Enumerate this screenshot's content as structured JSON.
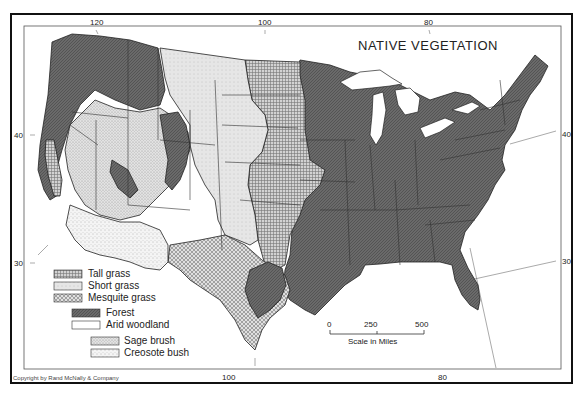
{
  "map": {
    "title": "NATIVE VEGETATION",
    "copyright": "Copyright by Rand McNally & Company",
    "longitude_labels_top": [
      "120",
      "100",
      "80"
    ],
    "longitude_labels_bottom": [
      "100",
      "80"
    ],
    "latitude_labels_left": [
      "40",
      "30"
    ],
    "latitude_labels_right": [
      "40",
      "30"
    ],
    "legend": {
      "groups": [
        [
          {
            "label": "Tall grass",
            "pattern": "tall-grass"
          },
          {
            "label": "Short grass",
            "pattern": "short-grass"
          },
          {
            "label": "Mesquite grass",
            "pattern": "mesquite-grass"
          }
        ],
        [
          {
            "label": "Forest",
            "pattern": "forest"
          },
          {
            "label": "Arid woodland",
            "pattern": "arid-woodland"
          }
        ],
        [
          {
            "label": "Sage brush",
            "pattern": "sage-brush"
          },
          {
            "label": "Creosote bush",
            "pattern": "creosote-bush"
          }
        ]
      ]
    },
    "scale": {
      "ticks": [
        "0",
        "250",
        "500"
      ],
      "label": "Scale in Miles"
    },
    "colors": {
      "forest": "#6e6e6e",
      "tall_grass": "#b8b8b8",
      "short_grass": "#e2e2e2",
      "mesquite": "#cfcfcf",
      "sage": "#d8d8d8",
      "frame": "#111111"
    }
  }
}
